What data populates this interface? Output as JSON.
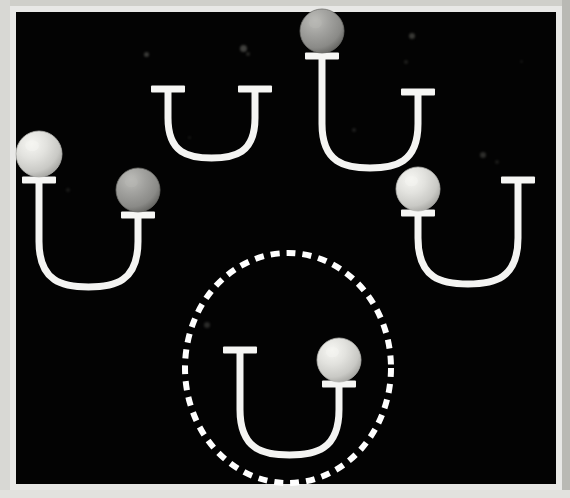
{
  "figure": {
    "kind": "u-tube-diagram",
    "canvas": {
      "width": 570,
      "height": 498
    },
    "background_color": "#030303",
    "border": {
      "top_color": "#cfcfca",
      "left_color": "#d8d8d4",
      "right_color": "#b9b9b4",
      "bottom_color": "#e2e2de",
      "outer_color": "#e8e8e6"
    },
    "panel": {
      "x": 10,
      "y": 6,
      "width": 552,
      "height": 484
    },
    "tube_color": "#f4f4f2",
    "tube_stroke_width": 7,
    "cap_color": "#f6f6f4",
    "cap_width": 34,
    "cap_height": 7,
    "sphere_colors": {
      "light": "#dcdcd8",
      "light_highlight": "#f4f4f0",
      "light_edge": "#b4b4b0",
      "medium": "#9a9a97",
      "medium_highlight": "#b6b6b2",
      "medium_edge": "#6e6e6b"
    },
    "highlight_ellipse": {
      "center_x": 288,
      "center_y": 368,
      "radius_x": 103,
      "radius_y": 115,
      "color": "#ffffff",
      "stroke_width": 6,
      "dash": "9 7",
      "style": "dashed"
    }
  },
  "tubes": [
    {
      "id": "tube-top-center",
      "label": "empty u-tube top center",
      "left_arm": {
        "x": 168,
        "cap_y": 89,
        "cap_label": "left-cap"
      },
      "right_arm": {
        "x": 255,
        "cap_y": 89,
        "cap_label": "right-cap"
      },
      "bottom_y": 158,
      "spheres": []
    },
    {
      "id": "tube-top-right",
      "label": "u-tube top right with medium sphere on left arm",
      "left_arm": {
        "x": 322,
        "cap_y": 56,
        "cap_label": "left-cap"
      },
      "right_arm": {
        "x": 418,
        "cap_y": 92,
        "cap_label": "right-cap"
      },
      "bottom_y": 168,
      "spheres": [
        {
          "arm": "left",
          "shade": "medium",
          "radius": 22,
          "center_x": 322,
          "center_y": 31
        }
      ]
    },
    {
      "id": "tube-left",
      "label": "u-tube left with light sphere on left arm and medium sphere on right arm",
      "left_arm": {
        "x": 39,
        "cap_y": 180,
        "cap_label": "left-cap"
      },
      "right_arm": {
        "x": 138,
        "cap_y": 215,
        "cap_label": "right-cap"
      },
      "bottom_y": 287,
      "spheres": [
        {
          "arm": "left",
          "shade": "light",
          "radius": 23,
          "center_x": 39,
          "center_y": 154
        },
        {
          "arm": "right",
          "shade": "medium",
          "radius": 22,
          "center_x": 138,
          "center_y": 190
        }
      ]
    },
    {
      "id": "tube-right",
      "label": "u-tube right with light sphere on left arm",
      "left_arm": {
        "x": 418,
        "cap_y": 213,
        "cap_label": "left-cap"
      },
      "right_arm": {
        "x": 518,
        "cap_y": 180,
        "cap_label": "right-cap"
      },
      "bottom_y": 284,
      "spheres": [
        {
          "arm": "left",
          "shade": "light",
          "radius": 22,
          "center_x": 418,
          "center_y": 189
        }
      ]
    },
    {
      "id": "tube-bottom-center-highlighted",
      "label": "u-tube bottom center inside dashed ellipse with light sphere on right arm",
      "left_arm": {
        "x": 240,
        "cap_y": 350,
        "cap_label": "left-cap"
      },
      "right_arm": {
        "x": 339,
        "cap_y": 384,
        "cap_label": "right-cap"
      },
      "bottom_y": 455,
      "spheres": [
        {
          "arm": "right",
          "shade": "light",
          "radius": 22,
          "center_x": 339,
          "center_y": 360
        }
      ]
    }
  ],
  "specks": [
    {
      "x": 144,
      "y": 52,
      "size": 5,
      "color": "#4d4d4a",
      "opacity": 0.75
    },
    {
      "x": 240,
      "y": 45,
      "size": 7,
      "color": "#5a5a56",
      "opacity": 0.7
    },
    {
      "x": 246,
      "y": 52,
      "size": 4,
      "color": "#3f3f3c",
      "opacity": 0.6
    },
    {
      "x": 409,
      "y": 33,
      "size": 6,
      "color": "#55554f",
      "opacity": 0.65
    },
    {
      "x": 404,
      "y": 60,
      "size": 4,
      "color": "#3a3a37",
      "opacity": 0.5
    },
    {
      "x": 480,
      "y": 152,
      "size": 6,
      "color": "#4a4a46",
      "opacity": 0.6
    },
    {
      "x": 495,
      "y": 160,
      "size": 4,
      "color": "#333330",
      "opacity": 0.5
    },
    {
      "x": 66,
      "y": 188,
      "size": 4,
      "color": "#2e2e2c",
      "opacity": 0.55
    },
    {
      "x": 204,
      "y": 322,
      "size": 6,
      "color": "#454542",
      "opacity": 0.6
    },
    {
      "x": 188,
      "y": 136,
      "size": 3,
      "color": "#2a2a28",
      "opacity": 0.5
    },
    {
      "x": 352,
      "y": 128,
      "size": 4,
      "color": "#3c3c39",
      "opacity": 0.5
    },
    {
      "x": 520,
      "y": 60,
      "size": 3,
      "color": "#2b2b29",
      "opacity": 0.45
    }
  ]
}
